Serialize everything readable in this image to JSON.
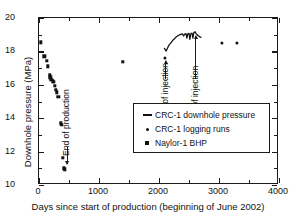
{
  "chart_data": {
    "type": "scatter",
    "title": "",
    "xlabel": "Days since start of production (beginning of June 2002)",
    "ylabel": "Downhole pressure (MPa)",
    "xlim": [
      0,
      4000
    ],
    "ylim": [
      10,
      20
    ],
    "xticks": [
      0,
      1000,
      2000,
      3000,
      4000
    ],
    "yticks": [
      10,
      12,
      14,
      16,
      18,
      20
    ],
    "x_minor_ticks": [
      500,
      1500,
      2500,
      3500
    ],
    "y_minor_ticks": [
      11,
      13,
      15,
      17,
      19
    ],
    "grid": false,
    "legend_position": "lower right",
    "series": [
      {
        "name": "CRC-1 downhole pressure",
        "marker": "line",
        "type": "line",
        "points": [
          [
            2090,
            18.18
          ],
          [
            2120,
            18.02
          ],
          [
            2160,
            18.34
          ],
          [
            2200,
            18.52
          ],
          [
            2240,
            18.7
          ],
          [
            2280,
            18.84
          ],
          [
            2320,
            18.95
          ],
          [
            2360,
            19.02
          ],
          [
            2390,
            19.05
          ],
          [
            2410,
            18.92
          ],
          [
            2430,
            19.04
          ],
          [
            2450,
            19.06
          ],
          [
            2465,
            18.8
          ],
          [
            2480,
            19.05
          ],
          [
            2500,
            19.08
          ],
          [
            2515,
            18.72
          ],
          [
            2530,
            19.06
          ],
          [
            2550,
            19.1
          ],
          [
            2565,
            18.8
          ],
          [
            2580,
            19.12
          ],
          [
            2600,
            19.18
          ],
          [
            2620,
            19.05
          ],
          [
            2650,
            18.95
          ],
          [
            2680,
            18.87
          ],
          [
            2700,
            18.84
          ]
        ]
      },
      {
        "name": "CRC-1 logging runs",
        "marker": "dot",
        "type": "scatter",
        "points": [
          [
            2100,
            17.62
          ],
          [
            3050,
            18.48
          ],
          [
            3300,
            18.48
          ]
        ]
      },
      {
        "name": "Naylor-1 BHP",
        "marker": "square",
        "type": "scatter",
        "points": [
          [
            30,
            18.55
          ],
          [
            90,
            17.7
          ],
          [
            130,
            17.45
          ],
          [
            150,
            17.1
          ],
          [
            175,
            16.6
          ],
          [
            190,
            16.45
          ],
          [
            205,
            16.3
          ],
          [
            235,
            16.2
          ],
          [
            250,
            16.18
          ],
          [
            265,
            15.95
          ],
          [
            285,
            15.7
          ],
          [
            300,
            15.55
          ],
          [
            320,
            15.28
          ],
          [
            365,
            13.7
          ],
          [
            375,
            13.62
          ],
          [
            400,
            11.62
          ],
          [
            410,
            11.0
          ],
          [
            430,
            10.95
          ],
          [
            1400,
            17.38
          ]
        ]
      }
    ],
    "annotations": [
      {
        "label": "End of production",
        "x": 460,
        "y_text_bottom": 12.35,
        "arrow_from_y": 12.25,
        "arrow_to_y": 11.25,
        "arrow": true
      },
      {
        "label": "Start of injection",
        "x": 2105,
        "y_text_bottom": 14.25,
        "arrow_from_y": 16.35,
        "arrow_to_y": 17.45,
        "arrow": true
      },
      {
        "label": "End of injection",
        "x": 2600,
        "y_text_bottom": 14.25,
        "arrow_from_y": 16.35,
        "arrow_to_y": 18.95,
        "arrow": true
      }
    ],
    "legend_entries": [
      {
        "label": "CRC-1 downhole pressure",
        "key": "line"
      },
      {
        "label": "CRC-1 logging runs",
        "key": "dot"
      },
      {
        "label": "Naylor-1 BHP",
        "key": "square"
      }
    ]
  },
  "colors": {
    "axis": "#1a1a1a",
    "marker": "#111111",
    "background": "#ffffff"
  }
}
